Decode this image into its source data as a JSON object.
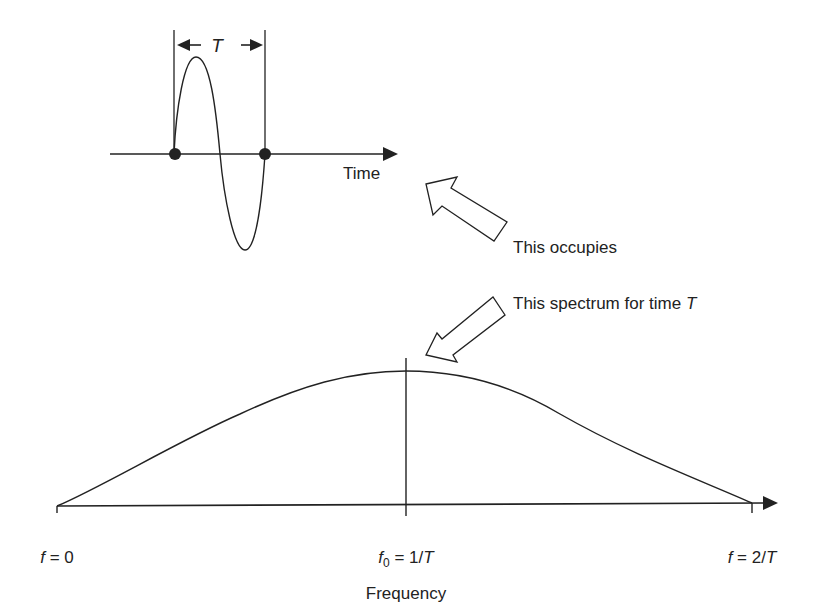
{
  "diagram": {
    "time_panel": {
      "axis_label": "Time",
      "period_label": "T",
      "markers": [
        "start",
        "end"
      ]
    },
    "annotations": {
      "upper_arrow_text": "This occupies",
      "lower_arrow_text_prefix": "This spectrum for time ",
      "lower_arrow_text_var": "T"
    },
    "frequency_panel": {
      "axis_label": "Frequency",
      "tick_left": {
        "var": "f",
        "rest": " = 0"
      },
      "tick_center": {
        "var": "f",
        "sub": "0",
        "rest": " = 1/",
        "var2": "T"
      },
      "tick_right": {
        "var": "f",
        "rest": " = 2/",
        "var2": "T"
      }
    },
    "colors": {
      "ink": "#222222",
      "background": "#ffffff"
    }
  }
}
